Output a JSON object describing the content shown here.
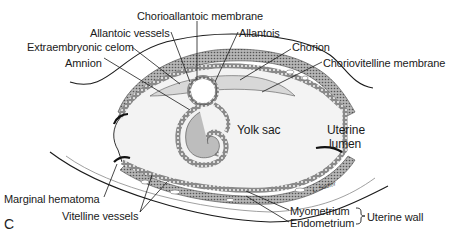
{
  "figure": {
    "panel_letter": "C",
    "artist_signature": "L. Sadler",
    "labels": {
      "chorioallantoic_membrane": "Chorioallantoic membrane",
      "allantoic_vessels": "Allantoic vessels",
      "allantois": "Allantois",
      "extraembryonic_celom": "Extraembryonic celom",
      "chorion": "Chorion",
      "amnion": "Amnion",
      "choriovitelline_membrane": "Choriovitelline membrane",
      "yolk_sac": "Yolk sac",
      "uterine_lumen_line1": "Uterine",
      "uterine_lumen_line2": "lumen",
      "marginal_hematoma": "Marginal hematoma",
      "vitelline_vessels": "Vitelline vessels",
      "myometrium": "Myometrium",
      "endometrium": "Endometrium",
      "uterine_wall": "Uterine wall"
    },
    "colors": {
      "background": "#ffffff",
      "tissue_dark": "#5a5a5a",
      "tissue_mid": "#9a9a9a",
      "tissue_light": "#d0d0d0",
      "cavity": "#eeeeee",
      "embryo_fill": "#b8b8b8",
      "line": "#1a1a1a"
    }
  }
}
